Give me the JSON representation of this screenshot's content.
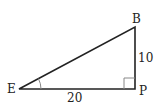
{
  "diagram": {
    "type": "right-triangle",
    "vertices": {
      "E": {
        "label": "E"
      },
      "B": {
        "label": "B"
      },
      "P": {
        "label": "P"
      }
    },
    "sides": {
      "EP": {
        "length_label": "20"
      },
      "BP": {
        "length_label": "10"
      }
    },
    "right_angle_at": "P",
    "marked_angle_at": "E",
    "colors": {
      "stroke": "#222222",
      "marker": "#888888"
    }
  }
}
